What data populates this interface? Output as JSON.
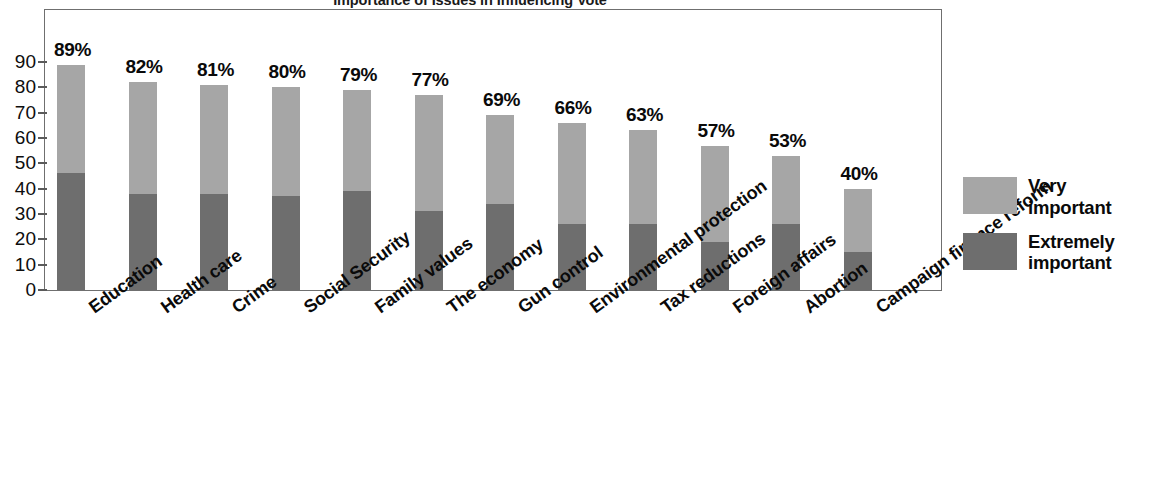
{
  "chart_data": {
    "type": "bar",
    "subtype": "stacked-vertical",
    "title": "Importance of Issues in Influencing Vote",
    "xlabel": "",
    "ylabel": "",
    "ylim": [
      0,
      90
    ],
    "yticks": [
      0,
      10,
      20,
      30,
      40,
      50,
      60,
      70,
      80,
      90
    ],
    "grid": false,
    "legend_position": "right",
    "categories": [
      "Education",
      "Health care",
      "Crime",
      "Social Security",
      "Family values",
      "The economy",
      "Gun control",
      "Environmental protection",
      "Tax reductions",
      "Foreign affairs",
      "Abortion",
      "Campaign finance reform"
    ],
    "series": [
      {
        "name": "Extremely important",
        "color": "#6e6e6e",
        "values": [
          46,
          38,
          38,
          37,
          39,
          31,
          34,
          26,
          26,
          19,
          26,
          15
        ]
      },
      {
        "name": "Very important",
        "color": "#a6a6a6",
        "values": [
          43,
          44,
          43,
          43,
          40,
          46,
          35,
          40,
          37,
          38,
          27,
          25
        ]
      }
    ],
    "totals": [
      89,
      82,
      81,
      80,
      79,
      77,
      69,
      66,
      63,
      57,
      53,
      40
    ],
    "data_labels": [
      "89%",
      "82%",
      "81%",
      "80%",
      "79%",
      "77%",
      "69%",
      "66%",
      "63%",
      "57%",
      "53%",
      "40%"
    ]
  },
  "legend": {
    "items": [
      {
        "label_line1": "Very",
        "label_line2": "important",
        "color": "#a6a6a6"
      },
      {
        "label_line1": "Extremely",
        "label_line2": "important",
        "color": "#6e6e6e"
      }
    ]
  },
  "colors": {
    "very_important": "#a6a6a6",
    "extremely_important": "#6e6e6e",
    "axis": "#6f6f6f",
    "text": "#0a0a0a",
    "background": "#ffffff"
  }
}
